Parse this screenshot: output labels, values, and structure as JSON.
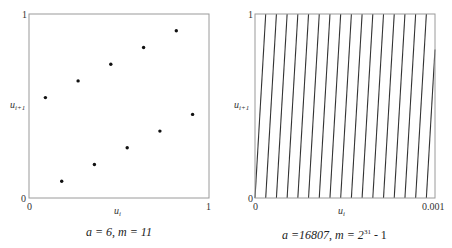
{
  "chart_data": [
    {
      "type": "scatter",
      "title": "a = 6, m = 11",
      "caption": {
        "a_label": "a = 6",
        "separator": ", ",
        "m_label": "m = 11"
      },
      "xlabel": "u_i",
      "ylabel": "u_{i+1}",
      "xlim": [
        0,
        1
      ],
      "ylim": [
        0,
        1
      ],
      "x_ticks": [
        "0",
        "1"
      ],
      "y_ticks": [
        "0",
        "1"
      ],
      "grid": false,
      "legend": null,
      "generator": {
        "a": 6,
        "m": 11
      },
      "points": [
        {
          "x": 0.0909,
          "y": 0.5455
        },
        {
          "x": 0.1818,
          "y": 0.0909
        },
        {
          "x": 0.2727,
          "y": 0.6364
        },
        {
          "x": 0.3636,
          "y": 0.1818
        },
        {
          "x": 0.4545,
          "y": 0.7273
        },
        {
          "x": 0.5455,
          "y": 0.2727
        },
        {
          "x": 0.6364,
          "y": 0.8182
        },
        {
          "x": 0.7273,
          "y": 0.3636
        },
        {
          "x": 0.8182,
          "y": 0.9091
        },
        {
          "x": 0.9091,
          "y": 0.4545
        }
      ]
    },
    {
      "type": "scatter",
      "title": "a =16807, m = 2^31 - 1",
      "caption": {
        "a_label": "a =16807",
        "separator": ", ",
        "m_prefix": "m = 2",
        "m_exp": "31",
        "m_suffix": " - 1"
      },
      "xlabel": "u_i",
      "ylabel": "u_{i+1}",
      "xlim": [
        0,
        0.001
      ],
      "ylim": [
        0,
        1
      ],
      "x_ticks": [
        "0",
        "0.001"
      ],
      "y_ticks": [
        "0",
        "1"
      ],
      "grid": false,
      "legend": null,
      "generator": {
        "a": 16807,
        "m": 2147483647
      },
      "description": "Points fall on parallel lines u_{i+1} = 16807*u_i - k for k = 0..16; about 17 dense lines visible across the range",
      "line_count": 17,
      "line_slope": 16807
    }
  ],
  "labels": {
    "left": {
      "y_axis": {
        "base": "u",
        "sub": "i+1"
      },
      "x_axis": {
        "base": "u",
        "sub": "i"
      },
      "x_tick_min": "0",
      "x_tick_max": "1",
      "y_tick_min": "0",
      "y_tick_max": "1"
    },
    "right": {
      "y_axis": {
        "base": "u",
        "sub": "i+1"
      },
      "x_axis": {
        "base": "u",
        "sub": "i"
      },
      "x_tick_min": "0",
      "x_tick_max": "0.001",
      "y_tick_min": "0",
      "y_tick_max": "1"
    }
  },
  "colors": {
    "frame": "#9a9a9a",
    "points": "#111111",
    "lines": "#333333"
  }
}
